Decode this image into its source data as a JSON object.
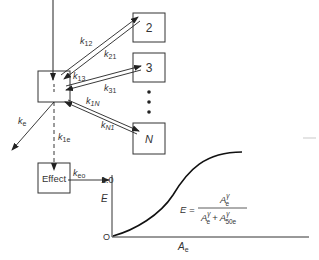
{
  "diagram": {
    "type": "multicompartment pharmacokinetic-pharmacodynamic model with effect compartment",
    "compartments": [
      {
        "id": "central",
        "label": ""
      },
      {
        "id": "c2",
        "label": "2"
      },
      {
        "id": "c3",
        "label": "3"
      },
      {
        "id": "cN",
        "label": "N"
      },
      {
        "id": "effect",
        "label": "Effect"
      }
    ],
    "ellipsis": "•••",
    "rate_constants": {
      "k12": {
        "k": "k",
        "sub": "12"
      },
      "k21": {
        "k": "k",
        "sub": "21"
      },
      "k13": {
        "k": "k",
        "sub": "13"
      },
      "k31": {
        "k": "k",
        "sub": "31"
      },
      "k1N": {
        "k": "k",
        "sub": "1N"
      },
      "kN1": {
        "k": "k",
        "sub": "N1"
      },
      "ke": {
        "k": "k",
        "sub": "e"
      },
      "k1e": {
        "k": "k",
        "sub": "1e"
      },
      "keo": {
        "k": "k",
        "sub": "eo"
      }
    },
    "graph": {
      "y_axis_label": "E",
      "y_max_label": "1.0",
      "origin_label": "O",
      "x_axis_label": "A",
      "x_axis_sub": "e",
      "equation": {
        "lhs": "E =",
        "numerator": {
          "base": "A",
          "sup": "γ",
          "sub": "e"
        },
        "denominator": {
          "term1": {
            "base": "A",
            "sup": "γ",
            "sub": "e"
          },
          "plus": "+",
          "term2": {
            "base": "A",
            "sup": "γ",
            "sub": "50e"
          }
        }
      }
    }
  }
}
